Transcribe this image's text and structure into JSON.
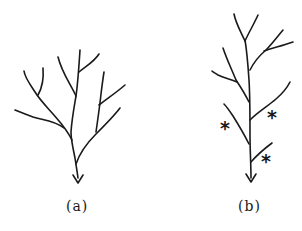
{
  "figure": {
    "panels": [
      {
        "id": "a",
        "label": "(a)",
        "description": "Branching tree (river/drainage network) with arrow indicating outflow at bottom"
      },
      {
        "id": "b",
        "label": "(b)",
        "description": "Branching tree with a single long main trunk; three side branches marked with asterisks",
        "markers": [
          "*",
          "*",
          "*"
        ]
      }
    ],
    "colors": {
      "line": "#1a1a1a",
      "background": "#ffffff"
    }
  }
}
